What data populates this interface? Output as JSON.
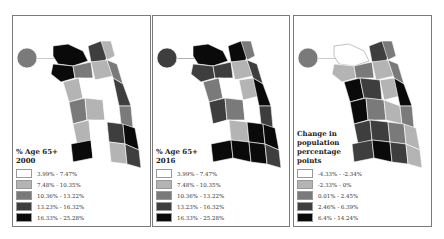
{
  "panels": [
    {
      "title": "% Age 65+ 2000",
      "title_lines": [
        "% Age 65+",
        "2000"
      ],
      "legend": [
        {
          "label": "3.99% - 7.47%",
          "color": "#ffffff"
        },
        {
          "label": "7.48% - 10.35%",
          "color": "#b4b4b4"
        },
        {
          "label": "10.36% - 13.22%",
          "color": "#7a7a7a"
        },
        {
          "label": "13.23% - 16.32%",
          "color": "#3e3e3e"
        },
        {
          "label": "16.33% - 25.28%",
          "color": "#0a0a0a"
        }
      ]
    },
    {
      "title": "% Age 65+ 2016",
      "title_lines": [
        "% Age 65+",
        "2016"
      ],
      "legend": [
        {
          "label": "3.99% - 7.47%",
          "color": "#ffffff"
        },
        {
          "label": "7.48% - 10.35%",
          "color": "#b4b4b4"
        },
        {
          "label": "10.36% - 13.22%",
          "color": "#7a7a7a"
        },
        {
          "label": "13.23% - 16.32%",
          "color": "#3e3e3e"
        },
        {
          "label": "16.33% - 25.28%",
          "color": "#0a0a0a"
        }
      ]
    },
    {
      "title": "Change in population percentage points",
      "title_lines": [
        "Change in",
        "population",
        "percentage",
        "points"
      ],
      "legend": [
        {
          "label": "-4.33% - -2.34%",
          "color": "#ffffff"
        },
        {
          "label": "-2.33% - 0%",
          "color": "#b4b4b4"
        },
        {
          "label": "0.01% - 2.45%",
          "color": "#7a7a7a"
        },
        {
          "label": "2.46% - 6.39%",
          "color": "#3e3e3e"
        },
        {
          "label": "6.4% - 14.24%",
          "color": "#0a0a0a"
        }
      ]
    }
  ]
}
